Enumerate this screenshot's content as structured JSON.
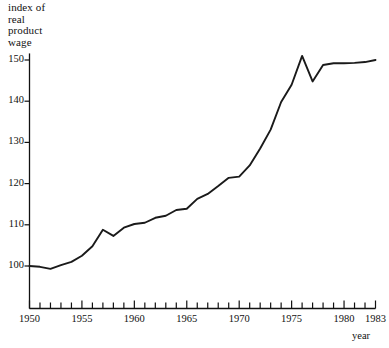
{
  "chart_data": {
    "type": "line",
    "title": "index of real product wage",
    "title_lines": "index of\nreal\nproduct\nwage",
    "xlabel": "year",
    "ylabel": "index of real product wage",
    "xlim": [
      1950,
      1983
    ],
    "ylim": [
      95,
      152
    ],
    "grid": false,
    "legend": false,
    "y_ticks": [
      100,
      110,
      120,
      130,
      140,
      150
    ],
    "x_ticks_major": [
      1950,
      1955,
      1960,
      1965,
      1970,
      1975,
      1980,
      1983
    ],
    "x_ticks_minor_step": 1,
    "line_color": "#1a1a1a",
    "background_color": "#ffffff",
    "x": [
      1950,
      1951,
      1952,
      1953,
      1954,
      1955,
      1956,
      1957,
      1958,
      1959,
      1960,
      1961,
      1962,
      1963,
      1964,
      1965,
      1966,
      1967,
      1968,
      1969,
      1970,
      1971,
      1972,
      1973,
      1974,
      1975,
      1976,
      1977,
      1978,
      1979,
      1980,
      1981,
      1982,
      1983
    ],
    "y": [
      100.0,
      99.8,
      99.3,
      100.2,
      101.0,
      102.5,
      104.8,
      108.8,
      107.3,
      109.3,
      110.2,
      110.5,
      111.7,
      112.2,
      113.6,
      113.9,
      116.3,
      117.5,
      119.4,
      121.4,
      121.7,
      124.4,
      128.5,
      133.1,
      139.8,
      144.0,
      151.0,
      144.8,
      148.8,
      149.2,
      149.2,
      149.3,
      149.5,
      150.0
    ],
    "series": [
      {
        "name": "index of real product wage",
        "values": [
          100.0,
          99.8,
          99.3,
          100.2,
          101.0,
          102.5,
          104.8,
          108.8,
          107.3,
          109.3,
          110.2,
          110.5,
          111.7,
          112.2,
          113.6,
          113.9,
          116.3,
          117.5,
          119.4,
          121.4,
          121.7,
          124.4,
          128.5,
          133.1,
          139.8,
          144.0,
          151.0,
          144.8,
          148.8,
          149.2,
          149.2,
          149.3,
          149.5,
          150.0
        ]
      }
    ],
    "annotations": []
  },
  "axis": {
    "y_tick_labels": [
      "150",
      "140",
      "130",
      "120",
      "110",
      "100"
    ],
    "x_tick_labels": [
      "1950",
      "1955",
      "1960",
      "1965",
      "1970",
      "1975",
      "1980",
      "1983"
    ],
    "x_axis_caption": "year",
    "y_axis_caption": "index of\nreal\nproduct\nwage"
  }
}
